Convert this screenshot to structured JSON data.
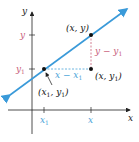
{
  "colors": {
    "line": "#3a9ad9",
    "axis": "#222222",
    "accent_pink": "#c8607a",
    "accent_blue": "#4aa3d8",
    "point": "#111111"
  },
  "axes": {
    "x_label": "x",
    "y_label": "y"
  },
  "ticks": {
    "x1_label": "x",
    "x1_sub": "1",
    "x_label": "x",
    "y_label": "y",
    "y1_label": "y",
    "y1_sub": "1"
  },
  "points": {
    "p_xy": "(x, y)",
    "p_xy1_main": "(x, y",
    "p_xy1_sub": "1",
    "p_xy1_close": ")",
    "p_x1y1_a": "(x",
    "p_x1y1_sub1": "1",
    "p_x1y1_b": ", y",
    "p_x1y1_sub2": "1",
    "p_x1y1_c": ")"
  },
  "segments": {
    "horizontal_a": "x − x",
    "horizontal_sub": "1",
    "vertical_a": "y − y",
    "vertical_sub": "1"
  }
}
